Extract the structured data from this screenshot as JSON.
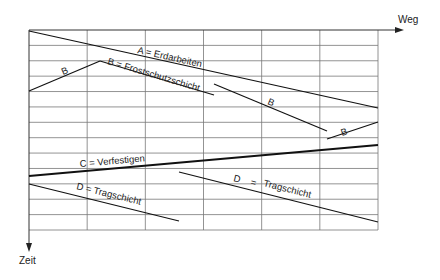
{
  "axes": {
    "x_label": "Weg",
    "y_label": "Zeit"
  },
  "grid": {
    "x0": 29,
    "y0": 30,
    "x1": 378,
    "y1": 230,
    "columns": 6,
    "rows": 13,
    "line_color": "#777777"
  },
  "activities": [
    {
      "id": "A",
      "label": "A = Erdarbeiten",
      "segments": [
        [
          29,
          31,
          378,
          108
        ]
      ]
    },
    {
      "id": "B",
      "label": "B = Frostschutzschicht",
      "segments": [
        [
          29,
          91,
          100,
          61
        ],
        [
          100,
          61,
          214,
          95
        ],
        [
          214,
          84,
          327,
          131
        ],
        [
          327,
          139,
          378,
          122
        ]
      ]
    },
    {
      "id": "C",
      "label": "C = Verfestigen",
      "segments": [
        [
          29,
          176,
          378,
          145
        ]
      ]
    },
    {
      "id": "D",
      "label": "D = Tragschicht",
      "segments": [
        [
          29,
          184,
          179,
          221
        ],
        [
          179,
          172,
          378,
          222
        ]
      ]
    }
  ],
  "labels": {
    "a_main": "A = Erdarbeiten",
    "b_left": "B",
    "b_main": "B = Frostschutzschicht",
    "b_mid": "B",
    "b_right": "B",
    "c_main": "C = Verfestigen",
    "d_left": "D = Tragschicht",
    "d_right_letter": "D",
    "d_right_eq": "=",
    "d_right_word": "Tragschicht"
  }
}
